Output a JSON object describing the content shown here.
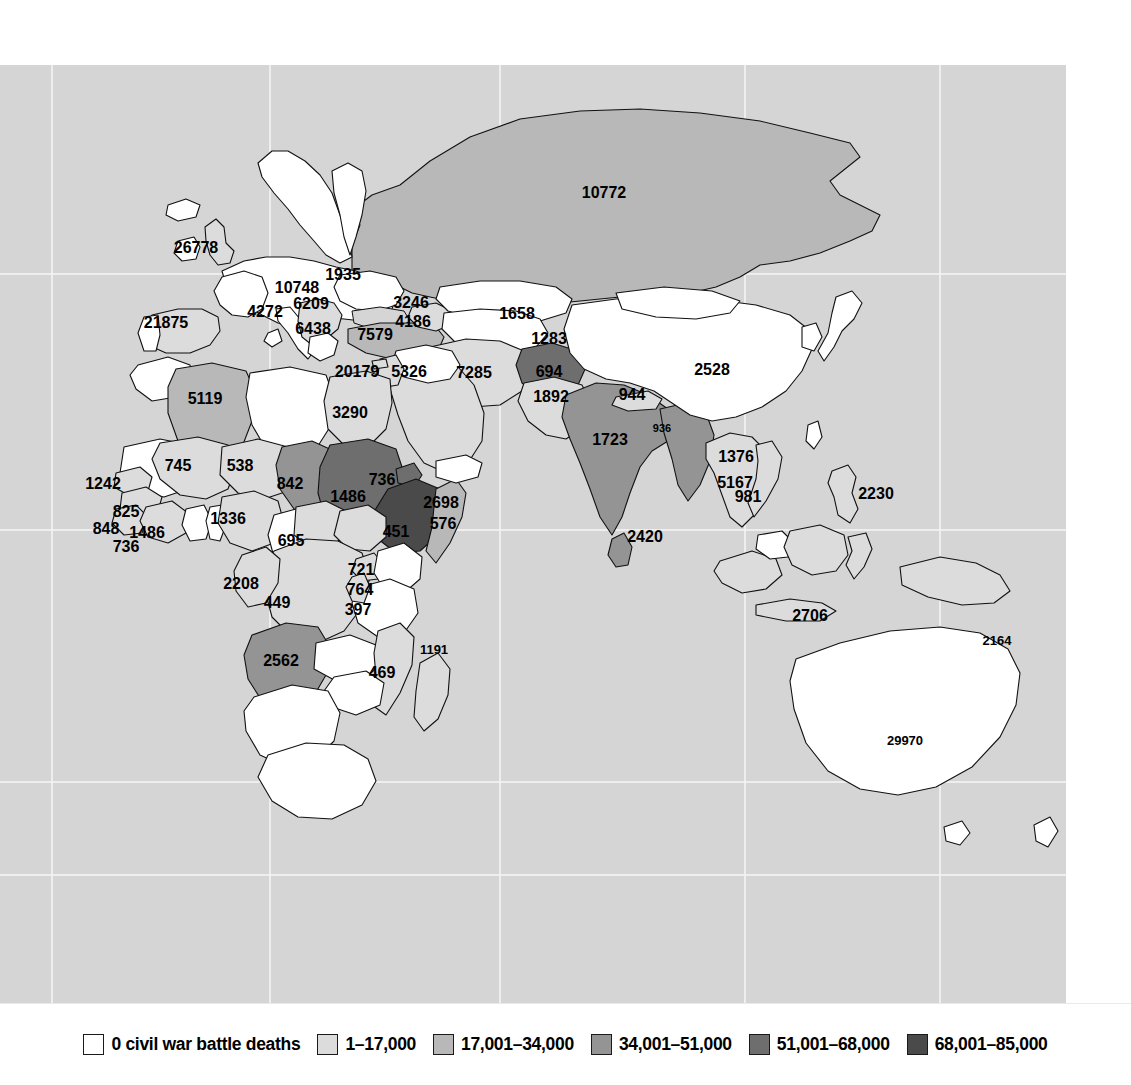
{
  "figure": {
    "kind": "choropleth-world-map",
    "variable": "civil war battle deaths",
    "ocean_color": "#d5d5d5",
    "border_color": "#111111",
    "page_background": "#ffffff"
  },
  "legend": {
    "position": "bottom",
    "items": [
      {
        "label": "0 civil war battle deaths",
        "color": "#ffffff",
        "bin_index": 0
      },
      {
        "label": "1–17,000",
        "color": "#dcdcdc",
        "bin_index": 1
      },
      {
        "label": "17,001–34,000",
        "color": "#b8b8b8",
        "bin_index": 2
      },
      {
        "label": "34,001–51,000",
        "color": "#949494",
        "bin_index": 3
      },
      {
        "label": "51,001–68,000",
        "color": "#6e6e6e",
        "bin_index": 4
      },
      {
        "label": "68,001–85,000",
        "color": "#4a4a4a",
        "bin_index": 5
      }
    ]
  },
  "chart_data": {
    "type": "heatmap",
    "title": "",
    "xlabel": "",
    "ylabel": "",
    "legend_position": "bottom",
    "grid": true,
    "color_bins": [
      {
        "label": "0 civil war battle deaths",
        "color": "#ffffff"
      },
      {
        "label": "1–17,000",
        "color": "#dcdcdc"
      },
      {
        "label": "17,001–34,000",
        "color": "#b8b8b8"
      },
      {
        "label": "34,001–51,000",
        "color": "#949494"
      },
      {
        "label": "51,001–68,000",
        "color": "#6e6e6e"
      },
      {
        "label": "68,001–85,000",
        "color": "#4a4a4a"
      }
    ],
    "labels": [
      {
        "value": "26778",
        "x": 196,
        "y": 188,
        "bin": 1,
        "size": 16
      },
      {
        "value": "21875",
        "x": 166,
        "y": 263,
        "bin": 1,
        "size": 16
      },
      {
        "value": "10748",
        "x": 297,
        "y": 228,
        "bin": 1,
        "size": 16
      },
      {
        "value": "1935",
        "x": 343,
        "y": 215,
        "bin": 1,
        "size": 16
      },
      {
        "value": "6209",
        "x": 311,
        "y": 244,
        "bin": 1,
        "size": 16
      },
      {
        "value": "4272",
        "x": 265,
        "y": 252,
        "bin": 1,
        "size": 16
      },
      {
        "value": "6438",
        "x": 313,
        "y": 269,
        "bin": 1,
        "size": 16
      },
      {
        "value": "7579",
        "x": 375,
        "y": 275,
        "bin": 2,
        "size": 16
      },
      {
        "value": "3246",
        "x": 411,
        "y": 243,
        "bin": 1,
        "size": 16
      },
      {
        "value": "4186",
        "x": 413,
        "y": 262,
        "bin": 1,
        "size": 16
      },
      {
        "value": "20179",
        "x": 357,
        "y": 312,
        "bin": 1,
        "size": 16
      },
      {
        "value": "5326",
        "x": 409,
        "y": 312,
        "bin": 1,
        "size": 16
      },
      {
        "value": "7285",
        "x": 474,
        "y": 313,
        "bin": 1,
        "size": 16
      },
      {
        "value": "1658",
        "x": 517,
        "y": 254,
        "bin": 0,
        "size": 16
      },
      {
        "value": "1283",
        "x": 549,
        "y": 279,
        "bin": 1,
        "size": 16
      },
      {
        "value": "694",
        "x": 549,
        "y": 312,
        "bin": 4,
        "size": 16,
        "light": true
      },
      {
        "value": "1892",
        "x": 551,
        "y": 337,
        "bin": 1,
        "size": 16
      },
      {
        "value": "944",
        "x": 632,
        "y": 335,
        "bin": 1,
        "size": 16
      },
      {
        "value": "2528",
        "x": 712,
        "y": 310,
        "bin": 0,
        "size": 16
      },
      {
        "value": "1723",
        "x": 610,
        "y": 380,
        "bin": 3,
        "size": 16
      },
      {
        "value": "936",
        "x": 662,
        "y": 367,
        "bin": 3,
        "size": 11
      },
      {
        "value": "1376",
        "x": 736,
        "y": 397,
        "bin": 1,
        "size": 16
      },
      {
        "value": "5167",
        "x": 735,
        "y": 423,
        "bin": 1,
        "size": 16
      },
      {
        "value": "981",
        "x": 748,
        "y": 437,
        "bin": 1,
        "size": 16
      },
      {
        "value": "2420",
        "x": 645,
        "y": 477,
        "bin": 3,
        "size": 16
      },
      {
        "value": "2230",
        "x": 876,
        "y": 434,
        "bin": 1,
        "size": 16
      },
      {
        "value": "2706",
        "x": 810,
        "y": 556,
        "bin": 1,
        "size": 16
      },
      {
        "value": "2164",
        "x": 997,
        "y": 580,
        "bin": 1,
        "size": 13
      },
      {
        "value": "29970",
        "x": 905,
        "y": 680,
        "bin": 0,
        "size": 13
      },
      {
        "value": "10772",
        "x": 604,
        "y": 133,
        "bin": 2,
        "size": 16
      },
      {
        "value": "5119",
        "x": 205,
        "y": 339,
        "bin": 2,
        "size": 16
      },
      {
        "value": "3290",
        "x": 350,
        "y": 353,
        "bin": 1,
        "size": 16
      },
      {
        "value": "745",
        "x": 178,
        "y": 406,
        "bin": 1,
        "size": 16
      },
      {
        "value": "538",
        "x": 240,
        "y": 406,
        "bin": 1,
        "size": 16
      },
      {
        "value": "842",
        "x": 290,
        "y": 424,
        "bin": 3,
        "size": 16
      },
      {
        "value": "1486",
        "x": 348,
        "y": 437,
        "bin": 4,
        "size": 16,
        "light": true
      },
      {
        "value": "736",
        "x": 382,
        "y": 420,
        "bin": 4,
        "size": 16
      },
      {
        "value": "2698",
        "x": 441,
        "y": 443,
        "bin": 1,
        "size": 16
      },
      {
        "value": "576",
        "x": 443,
        "y": 464,
        "bin": 2,
        "size": 16
      },
      {
        "value": "451",
        "x": 396,
        "y": 472,
        "bin": 5,
        "size": 16,
        "light": true
      },
      {
        "value": "1242",
        "x": 103,
        "y": 424,
        "bin": 1,
        "size": 16
      },
      {
        "value": "825",
        "x": 126,
        "y": 452,
        "bin": 1,
        "size": 16
      },
      {
        "value": "848",
        "x": 106,
        "y": 469,
        "bin": 1,
        "size": 16
      },
      {
        "value": "1486",
        "x": 147,
        "y": 473,
        "bin": 1,
        "size": 16
      },
      {
        "value": "736",
        "x": 126,
        "y": 487,
        "bin": 1,
        "size": 16
      },
      {
        "value": "1336",
        "x": 228,
        "y": 459,
        "bin": 1,
        "size": 16
      },
      {
        "value": "695",
        "x": 291,
        "y": 481,
        "bin": 1,
        "size": 16
      },
      {
        "value": "721",
        "x": 361,
        "y": 510,
        "bin": 1,
        "size": 16
      },
      {
        "value": "764",
        "x": 360,
        "y": 530,
        "bin": 1,
        "size": 16
      },
      {
        "value": "397",
        "x": 358,
        "y": 550,
        "bin": 1,
        "size": 16
      },
      {
        "value": "2208",
        "x": 241,
        "y": 524,
        "bin": 1,
        "size": 16
      },
      {
        "value": "449",
        "x": 277,
        "y": 543,
        "bin": 1,
        "size": 16
      },
      {
        "value": "2562",
        "x": 281,
        "y": 601,
        "bin": 3,
        "size": 16
      },
      {
        "value": "469",
        "x": 382,
        "y": 613,
        "bin": 1,
        "size": 16
      },
      {
        "value": "1191",
        "x": 434,
        "y": 589,
        "bin": 1,
        "size": 13
      }
    ]
  }
}
